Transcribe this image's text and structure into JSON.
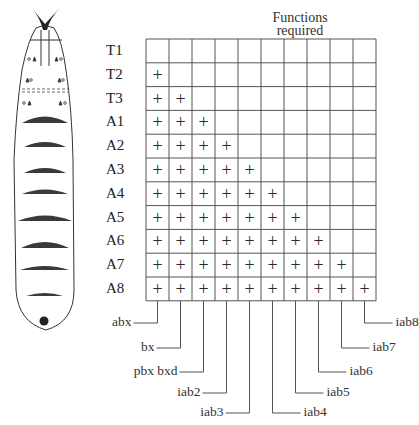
{
  "title": {
    "line1": "Functions",
    "line2": "required"
  },
  "segments": [
    "T1",
    "T2",
    "T3",
    "A1",
    "A2",
    "A3",
    "A4",
    "A5",
    "A6",
    "A7",
    "A8"
  ],
  "functions": [
    "abx",
    "bx",
    "pbx bxd",
    "iab2",
    "iab3",
    "iab4",
    "iab5",
    "iab6",
    "iab7",
    "iab8"
  ],
  "mark": "+",
  "matrix_rule": "segment index i requires functions 0..i-1",
  "labels_left": [
    {
      "text": "abx",
      "col": 0
    },
    {
      "text": "bx",
      "col": 1
    },
    {
      "text": "pbx bxd",
      "col": 2
    },
    {
      "text": "iab2",
      "col": 3
    },
    {
      "text": "iab3",
      "col": 4
    }
  ],
  "labels_right": [
    {
      "text": "iab4",
      "col": 5
    },
    {
      "text": "iab5",
      "col": 6
    },
    {
      "text": "iab6",
      "col": 7
    },
    {
      "text": "iab7",
      "col": 8
    },
    {
      "text": "iab8",
      "col": 9
    }
  ],
  "larva": {
    "thoracic_segments": 3,
    "abdominal_denticle_bands": 8,
    "has_head_skeleton": true,
    "has_anal_pad": true
  },
  "colors": {
    "line": "#555555",
    "ink": "#2a2a2a",
    "band": "#3a3a3a"
  }
}
